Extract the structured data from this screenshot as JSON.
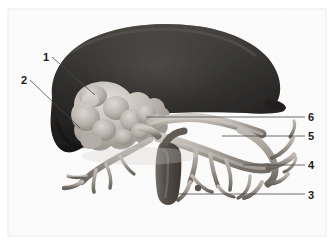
{
  "figure": {
    "kind": "anatomical-3d-render",
    "modality": "volume-rendered abdominal reconstruction",
    "caption": "",
    "background_color": "#fdfdfd",
    "plate_color": "#f4f4f4",
    "border_color": "#e2e2e2",
    "structures": [
      {
        "id": "liver",
        "name": "liver",
        "tone": "dark",
        "fill_color": "#201f1f",
        "highlight_color": "#3a3836",
        "shadow_color": "#121111"
      },
      {
        "id": "pancreas",
        "name": "pancreas",
        "tone": "light",
        "fill_color": "#b9b4ad",
        "highlight_color": "#d6d2cb",
        "shadow_color": "#8e8880"
      },
      {
        "id": "vascular-tree",
        "name": "vascular-tree",
        "tone": "mid",
        "fill_color": "#a6a099",
        "highlight_color": "#c9c4bd",
        "shadow_color": "#6f6a63"
      },
      {
        "id": "portal-vein",
        "name": "portal-vein",
        "tone": "dark-mid",
        "fill_color": "#5b5650",
        "highlight_color": "#7d7870",
        "shadow_color": "#3a3631"
      }
    ],
    "callouts": [
      {
        "number": "1",
        "side": "left",
        "label_x": 48,
        "label_y": 52,
        "line_from_x": 52,
        "line_from_y": 57,
        "line_to_x": 95,
        "line_to_y": 95
      },
      {
        "number": "2",
        "side": "left",
        "label_x": 26,
        "label_y": 75,
        "line_from_x": 30,
        "line_from_y": 80,
        "line_to_x": 80,
        "line_to_y": 128
      },
      {
        "number": "6",
        "side": "right",
        "label_x": 308,
        "label_y": 112,
        "line_from_x": 305,
        "line_from_y": 117,
        "line_to_x": 146,
        "line_to_y": 117
      },
      {
        "number": "5",
        "side": "right",
        "label_x": 308,
        "label_y": 131,
        "line_from_x": 305,
        "line_from_y": 136,
        "line_to_x": 222,
        "line_to_y": 136
      },
      {
        "number": "4",
        "side": "right",
        "label_x": 308,
        "label_y": 160,
        "line_from_x": 305,
        "line_from_y": 165,
        "line_to_x": 243,
        "line_to_y": 165
      },
      {
        "number": "3",
        "side": "right",
        "label_x": 308,
        "label_y": 190,
        "line_from_x": 305,
        "line_from_y": 194,
        "line_to_x": 172,
        "line_to_y": 194
      }
    ],
    "leader_line": {
      "color": "#4a4a4a",
      "width": 0.8
    }
  }
}
